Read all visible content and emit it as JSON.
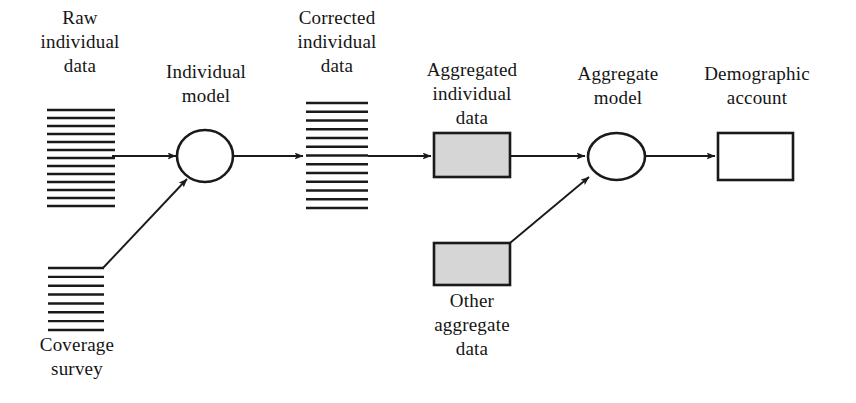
{
  "diagram": {
    "colors": {
      "stroke": "#1a1a1a",
      "shaded_fill": "#d6d6d6",
      "plain_fill": "#ffffff",
      "background": "#ffffff",
      "text": "#151515"
    },
    "nodes": [
      {
        "id": "raw-individual-data",
        "label": "Raw\nindividual\ndata",
        "shape": "line-stack",
        "lines": 13,
        "x": 47,
        "y": 110,
        "width": 68,
        "height": 96,
        "label_x": 25,
        "label_y": 6,
        "label_width": 110
      },
      {
        "id": "individual-model",
        "label": "Individual\nmodel",
        "shape": "ellipse",
        "x": 177,
        "y": 130,
        "width": 56,
        "height": 52,
        "label_x": 148,
        "label_y": 60,
        "label_width": 116
      },
      {
        "id": "corrected-individual-data",
        "label": "Corrected\nindividual\ndata",
        "shape": "line-stack",
        "lines": 13,
        "x": 306,
        "y": 103,
        "width": 62,
        "height": 105,
        "label_x": 282,
        "label_y": 6,
        "label_width": 110
      },
      {
        "id": "aggregated-individual-data",
        "label": "Aggregated\nindividual\ndata",
        "shape": "shaded-box",
        "x": 434,
        "y": 133,
        "width": 76,
        "height": 44,
        "label_x": 411,
        "label_y": 58,
        "label_width": 122
      },
      {
        "id": "aggregate-model",
        "label": "Aggregate\nmodel",
        "shape": "ellipse",
        "x": 588,
        "y": 133,
        "width": 57,
        "height": 47,
        "label_x": 560,
        "label_y": 62,
        "label_width": 116
      },
      {
        "id": "demographic-account",
        "label": "Demographic\naccount",
        "shape": "plain-box",
        "x": 718,
        "y": 133,
        "width": 75,
        "height": 47,
        "label_x": 688,
        "label_y": 62,
        "label_width": 138
      },
      {
        "id": "coverage-survey",
        "label": "Coverage\nsurvey",
        "shape": "line-stack",
        "lines": 8,
        "x": 48,
        "y": 268,
        "width": 56,
        "height": 62,
        "label_x": 23,
        "label_y": 333,
        "label_width": 108
      },
      {
        "id": "other-aggregate-data",
        "label": "Other\naggregate\ndata",
        "shape": "shaded-box",
        "x": 434,
        "y": 243,
        "width": 76,
        "height": 42,
        "label_x": 409,
        "label_y": 289,
        "label_width": 126
      }
    ],
    "edges": [
      {
        "id": "raw-to-individual-model",
        "from": "raw-individual-data",
        "to": "individual-model",
        "x1": 112,
        "y1": 156,
        "x2": 176,
        "y2": 156,
        "arrow": true
      },
      {
        "id": "individual-model-to-corrected",
        "from": "individual-model",
        "to": "corrected-individual-data",
        "x1": 234,
        "y1": 156,
        "x2": 303,
        "y2": 156,
        "arrow": true
      },
      {
        "id": "corrected-to-aggregated",
        "from": "corrected-individual-data",
        "to": "aggregated-individual-data",
        "x1": 368,
        "y1": 156,
        "x2": 431,
        "y2": 156,
        "arrow": true
      },
      {
        "id": "aggregated-to-aggregate-model",
        "from": "aggregated-individual-data",
        "to": "aggregate-model",
        "x1": 511,
        "y1": 156,
        "x2": 585,
        "y2": 156,
        "arrow": true
      },
      {
        "id": "aggregate-model-to-account",
        "from": "aggregate-model",
        "to": "demographic-account",
        "x1": 646,
        "y1": 156,
        "x2": 715,
        "y2": 156,
        "arrow": true
      },
      {
        "id": "coverage-to-individual-model",
        "from": "coverage-survey",
        "to": "individual-model",
        "x1": 103,
        "y1": 268,
        "x2": 187,
        "y2": 179,
        "arrow": true
      },
      {
        "id": "other-aggregate-to-aggregate-model",
        "from": "other-aggregate-data",
        "to": "aggregate-model",
        "x1": 510,
        "y1": 243,
        "x2": 589,
        "y2": 177,
        "arrow": true
      }
    ]
  }
}
